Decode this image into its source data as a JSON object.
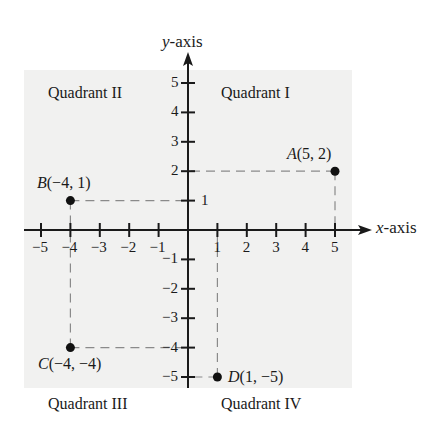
{
  "axes": {
    "x_label_var": "x",
    "x_label_rest": "-axis",
    "y_label_var": "y",
    "y_label_rest": "-axis"
  },
  "quadrants": {
    "q1": "Quadrant I",
    "q2": "Quadrant II",
    "q3": "Quadrant III",
    "q4": "Quadrant IV"
  },
  "points": {
    "A": {
      "name": "A",
      "coords": "(5, 2)",
      "x": 5,
      "y": 2
    },
    "B": {
      "name": "B",
      "coords": "(−4, 1)",
      "x": -4,
      "y": 1
    },
    "C": {
      "name": "C",
      "coords": "(−4, −4)",
      "x": -4,
      "y": -4
    },
    "D": {
      "name": "D",
      "coords": "(1, −5)",
      "x": 1,
      "y": -5
    }
  },
  "chart_data": {
    "type": "scatter",
    "title": "",
    "xlabel": "x-axis",
    "ylabel": "y-axis",
    "xlim": [
      -5,
      5
    ],
    "ylim": [
      -5,
      5
    ],
    "x_ticks": [
      -5,
      -4,
      -3,
      -2,
      -1,
      1,
      2,
      3,
      4,
      5
    ],
    "y_ticks": [
      -5,
      -4,
      -3,
      -2,
      -1,
      1,
      2,
      3,
      4,
      5
    ],
    "grid": false,
    "series": [
      {
        "name": "points",
        "labels": [
          "A",
          "B",
          "C",
          "D"
        ],
        "x": [
          5,
          -4,
          -4,
          1
        ],
        "y": [
          2,
          1,
          -4,
          -5
        ]
      }
    ],
    "annotations": [
      "Quadrant I",
      "Quadrant II",
      "Quadrant III",
      "Quadrant IV"
    ]
  }
}
